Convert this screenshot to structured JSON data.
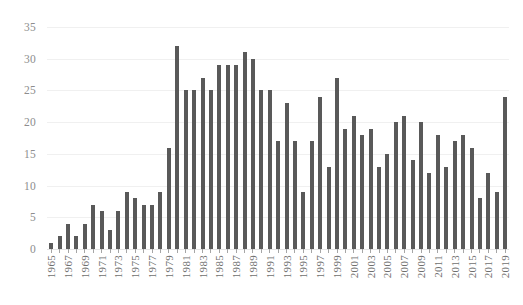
{
  "chart_data": {
    "type": "bar",
    "title": "",
    "subtitle": "",
    "xlabel": "",
    "ylabel": "",
    "ylim": [
      0,
      35
    ],
    "ytick_step": 5,
    "yticks": [
      0,
      5,
      10,
      15,
      20,
      25,
      30,
      35
    ],
    "ytick_labels": [
      "0",
      "5",
      "10",
      "15",
      "20",
      "25",
      "30",
      "35"
    ],
    "grid": true,
    "grid_axis": "y",
    "legend": false,
    "legend_position": "none",
    "bar_color": "#595959",
    "grid_color": "#f0f0f0",
    "axis_text_color": "#8d8d8d",
    "xtick_label_rotation": 90,
    "xtick_label_interval": 2,
    "categories": [
      "1965",
      "1966",
      "1967",
      "1968",
      "1969",
      "1970",
      "1971",
      "1972",
      "1973",
      "1974",
      "1975",
      "1976",
      "1977",
      "1978",
      "1979",
      "1980",
      "1981",
      "1982",
      "1983",
      "1984",
      "1985",
      "1986",
      "1987",
      "1988",
      "1989",
      "1990",
      "1991",
      "1992",
      "1993",
      "1994",
      "1995",
      "1996",
      "1997",
      "1998",
      "1999",
      "2000",
      "2001",
      "2002",
      "2003",
      "2004",
      "2005",
      "2006",
      "2007",
      "2008",
      "2009",
      "2010",
      "2011",
      "2012",
      "2013",
      "2014",
      "2015",
      "2016",
      "2017",
      "2018",
      "2019"
    ],
    "values": [
      1,
      2,
      4,
      2,
      4,
      7,
      6,
      3,
      6,
      9,
      8,
      7,
      7,
      9,
      16,
      32,
      25,
      25,
      27,
      25,
      29,
      29,
      29,
      31,
      30,
      25,
      25,
      17,
      23,
      17,
      9,
      17,
      24,
      13,
      27,
      19,
      21,
      18,
      19,
      13,
      15,
      20,
      21,
      14,
      20,
      12,
      18,
      13,
      17,
      18,
      16,
      8,
      12,
      9,
      24
    ]
  }
}
